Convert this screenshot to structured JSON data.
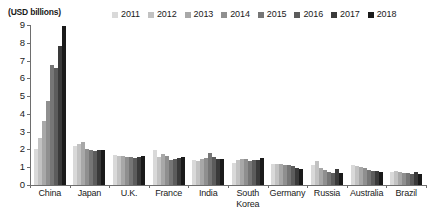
{
  "axis_unit_title": "(USD billions)",
  "chart_data": {
    "type": "bar",
    "title": "",
    "subtitle": "",
    "xlabel": "",
    "ylabel": "(USD billions)",
    "ylim": [
      0,
      9
    ],
    "ytick_labels": [
      "0",
      "1",
      "2",
      "3",
      "4",
      "5",
      "6",
      "7",
      "8",
      "9"
    ],
    "ytick_values": [
      0,
      1,
      2,
      3,
      4,
      5,
      6,
      7,
      8,
      9
    ],
    "grid": false,
    "legend_position": "top",
    "categories": [
      "China",
      "Japan",
      "U.K.",
      "France",
      "India",
      "South Korea",
      "Germany",
      "Russia",
      "Australia",
      "Brazil"
    ],
    "series": [
      {
        "name": "2011",
        "color": "#d9d9d9",
        "values": [
          2.05,
          2.2,
          1.7,
          1.95,
          1.4,
          1.25,
          1.2,
          1.1,
          1.15,
          0.75
        ]
      },
      {
        "name": "2012",
        "color": "#c2c2c2",
        "values": [
          2.65,
          2.3,
          1.65,
          1.6,
          1.35,
          1.4,
          1.2,
          1.35,
          1.05,
          0.8
        ]
      },
      {
        "name": "2013",
        "color": "#a8a8a8",
        "values": [
          3.6,
          2.4,
          1.65,
          1.75,
          1.45,
          1.45,
          1.2,
          0.95,
          1.0,
          0.75
        ]
      },
      {
        "name": "2014",
        "color": "#8f8f8f",
        "values": [
          4.75,
          2.05,
          1.6,
          1.65,
          1.5,
          1.45,
          1.15,
          0.85,
          0.95,
          0.7
        ]
      },
      {
        "name": "2015",
        "color": "#767676",
        "values": [
          6.75,
          1.95,
          1.6,
          1.4,
          1.8,
          1.35,
          1.1,
          0.75,
          0.85,
          0.65
        ]
      },
      {
        "name": "2016",
        "color": "#5c5c5c",
        "values": [
          6.6,
          1.9,
          1.5,
          1.45,
          1.55,
          1.4,
          1.05,
          0.65,
          0.8,
          0.6
        ]
      },
      {
        "name": "2017",
        "color": "#3a3a3a",
        "values": [
          7.8,
          1.95,
          1.6,
          1.5,
          1.45,
          1.4,
          0.95,
          0.9,
          0.8,
          0.75
        ]
      },
      {
        "name": "2018",
        "color": "#1a1a1a",
        "values": [
          8.95,
          1.95,
          1.65,
          1.55,
          1.45,
          1.5,
          0.9,
          0.65,
          0.75,
          0.6
        ]
      }
    ]
  }
}
